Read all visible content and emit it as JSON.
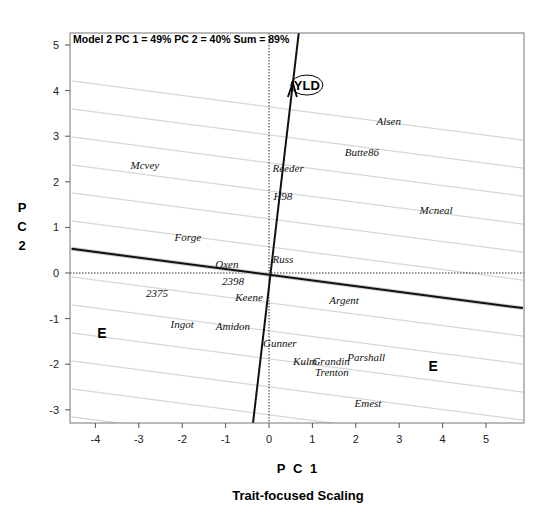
{
  "chart_data": {
    "type": "scatter",
    "subtype": "GGE biplot",
    "title": "Model 2 PC 1 = 49% PC 2 = 40% Sum = 89%",
    "subtitle": "Trait-focused Scaling",
    "xlabel": "P C 1",
    "ylabel": "P C 2",
    "xlim": [
      -4.55,
      5.85
    ],
    "ylim": [
      -3.3,
      5.3
    ],
    "xticks": [
      -4,
      -3,
      -2,
      -1,
      0,
      1,
      2,
      3,
      4,
      5
    ],
    "yticks": [
      -3,
      -2,
      -1,
      0,
      1,
      2,
      3,
      4,
      5
    ],
    "grid": false,
    "legend": null,
    "genotypes": [
      {
        "name": "Alsen",
        "x": 2.76,
        "y": 3.33
      },
      {
        "name": "Butte86",
        "x": 2.14,
        "y": 2.65
      },
      {
        "name": "Reeder",
        "x": 0.44,
        "y": 2.3
      },
      {
        "name": "H98",
        "x": 0.32,
        "y": 1.69
      },
      {
        "name": "Mcvey",
        "x": -2.86,
        "y": 2.37
      },
      {
        "name": "Mcneal",
        "x": 3.85,
        "y": 1.38
      },
      {
        "name": "Forge",
        "x": -1.87,
        "y": 0.79
      },
      {
        "name": "Russ",
        "x": 0.32,
        "y": 0.31
      },
      {
        "name": "Oxen",
        "x": -0.97,
        "y": 0.2
      },
      {
        "name": "2398",
        "x": -0.83,
        "y": -0.18
      },
      {
        "name": "2375",
        "x": -2.58,
        "y": -0.44
      },
      {
        "name": "Keene",
        "x": -0.46,
        "y": -0.53
      },
      {
        "name": "Argent",
        "x": 1.73,
        "y": -0.59
      },
      {
        "name": "Ingot",
        "x": -2.0,
        "y": -1.12
      },
      {
        "name": "Amidon",
        "x": -0.83,
        "y": -1.16
      },
      {
        "name": "Gunner",
        "x": 0.25,
        "y": -1.54
      },
      {
        "name": "Kulm",
        "x": 0.83,
        "y": -1.93
      },
      {
        "name": "Grandin",
        "x": 1.43,
        "y": -1.93
      },
      {
        "name": "Parshall",
        "x": 2.24,
        "y": -1.84
      },
      {
        "name": "Trenton",
        "x": 1.45,
        "y": -2.17
      },
      {
        "name": "Emest",
        "x": 2.28,
        "y": -2.85
      }
    ],
    "trait_vector": {
      "name": "YLD",
      "x": 0.55,
      "y": 4.1
    },
    "environment_markers": [
      {
        "name": "E",
        "x": -3.85,
        "y": -1.32
      },
      {
        "name": "E",
        "x": 3.78,
        "y": -2.05
      }
    ],
    "ate_abscissa": {
      "x1": -4.55,
      "y1": 0.53,
      "x2": 5.85,
      "y2": -0.77
    },
    "ate_ordinate": {
      "x1": 0.69,
      "y1": 5.3,
      "x2": -0.37,
      "y2": -3.3
    },
    "reference_lines": {
      "x": 0,
      "y": 0,
      "style": "dotted"
    },
    "perpendicular_lines_offsets_px": [
      -168,
      -140,
      -112,
      -84,
      -56,
      -28,
      28,
      56,
      84,
      112,
      140,
      168
    ]
  }
}
